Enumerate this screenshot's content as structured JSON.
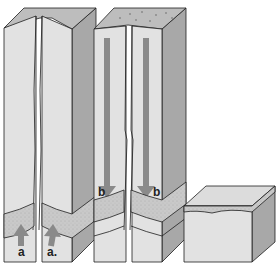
{
  "diagram": {
    "type": "geology-block-diagrams",
    "blocks": [
      {
        "id": "block-1",
        "description": "Tall rock block split by a vertical fracture, with a stippled permeable layer near the base",
        "labels": [
          "a",
          "a"
        ],
        "arrow_direction": "up"
      },
      {
        "id": "block-2",
        "description": "Tall rock block with a vertical fracture and stippled top surface, stippled layer near base",
        "labels": [
          "b",
          "b"
        ],
        "arrow_direction": "down"
      },
      {
        "id": "block-3",
        "description": "Short intact rock block with a stippled layer near the top",
        "labels": [],
        "arrow_direction": null
      }
    ],
    "colors": {
      "front_face": "#e2e2e2",
      "side_face": "#a8a8a8",
      "top_face": "#bdbdbd",
      "stipple_layer": "#c9c9c9",
      "arrow": "#8a8a8a",
      "outline": "#1e1e1e"
    }
  },
  "labels": {
    "a1": "a",
    "a2": "a.",
    "b1": "b",
    "b2": "b"
  }
}
